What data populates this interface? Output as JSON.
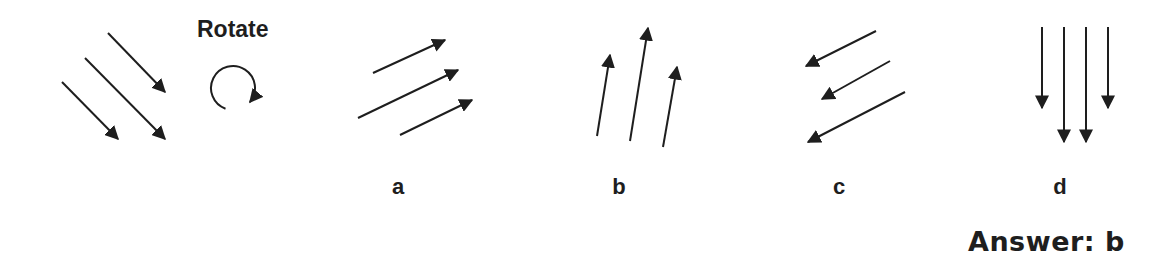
{
  "title": "Rotate",
  "prompt_figure": {
    "name": "original-arrows",
    "arrows": [
      {
        "x1": 108,
        "y1": 33,
        "x2": 165,
        "y2": 92
      },
      {
        "x1": 85,
        "y1": 58,
        "x2": 165,
        "y2": 139
      },
      {
        "x1": 62,
        "y1": 82,
        "x2": 118,
        "y2": 139
      }
    ]
  },
  "rotate_icon": {
    "name": "clockwise-rotate-icon",
    "cx": 233,
    "cy": 88,
    "r": 22
  },
  "options": [
    {
      "label": "a",
      "label_x": 398,
      "arrows": [
        {
          "x1": 373,
          "y1": 73,
          "x2": 445,
          "y2": 40
        },
        {
          "x1": 358,
          "y1": 118,
          "x2": 458,
          "y2": 70
        },
        {
          "x1": 400,
          "y1": 135,
          "x2": 472,
          "y2": 100
        }
      ]
    },
    {
      "label": "b",
      "label_x": 619,
      "arrows": [
        {
          "x1": 597,
          "y1": 136,
          "x2": 610,
          "y2": 55
        },
        {
          "x1": 630,
          "y1": 141,
          "x2": 648,
          "y2": 28
        },
        {
          "x1": 663,
          "y1": 147,
          "x2": 677,
          "y2": 67
        }
      ]
    },
    {
      "label": "c",
      "label_x": 839,
      "arrows": [
        {
          "x1": 876,
          "y1": 31,
          "x2": 806,
          "y2": 66
        },
        {
          "x1": 890,
          "y1": 61,
          "x2": 822,
          "y2": 99
        },
        {
          "x1": 905,
          "y1": 92,
          "x2": 808,
          "y2": 142
        }
      ]
    },
    {
      "label": "d",
      "label_x": 1060,
      "arrows": [
        {
          "x1": 1042,
          "y1": 27,
          "x2": 1042,
          "y2": 108
        },
        {
          "x1": 1064,
          "y1": 27,
          "x2": 1064,
          "y2": 142
        },
        {
          "x1": 1086,
          "y1": 27,
          "x2": 1086,
          "y2": 142
        },
        {
          "x1": 1108,
          "y1": 27,
          "x2": 1108,
          "y2": 108
        }
      ]
    }
  ],
  "answer": "Answer: b",
  "colors": {
    "stroke": "#1e1e1e",
    "background": "#ffffff"
  }
}
